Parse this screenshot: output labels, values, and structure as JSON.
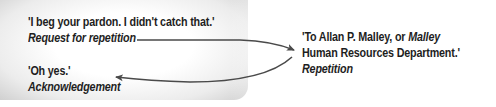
{
  "left_panel": {
    "utterance_1": {
      "quote": "'I beg your pardon. I didn't catch that.'",
      "label": "Request for repetition"
    },
    "utterance_3": {
      "quote": "'Oh yes.'",
      "label": "Acknowledgement"
    }
  },
  "right_panel": {
    "utterance_2": {
      "quote_line1_prefix": "'To Allan P. Malley, or ",
      "quote_line1_italic": "Malley",
      "quote_line2": "Human Resources Department.'",
      "label": "Repetition"
    }
  },
  "arrows": [
    {
      "from": "Request for repetition",
      "to": "Repetition"
    },
    {
      "from": "Repetition",
      "to": "Acknowledgement"
    }
  ],
  "colors": {
    "text": "#1e1e1e",
    "arrow": "#4a4a4a",
    "panel_edge": "#cfcfcf"
  }
}
